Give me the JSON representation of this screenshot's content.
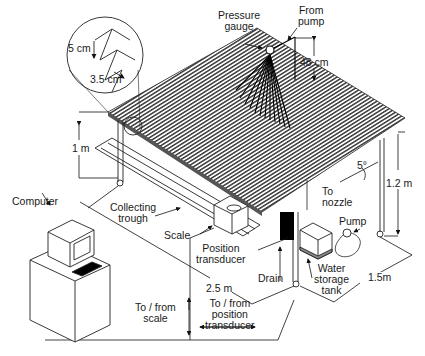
{
  "diagram": {
    "type": "experimental apparatus schematic",
    "labels": {
      "pressure_gauge": [
        "Pressure",
        "gauge"
      ],
      "from_pump": [
        "From",
        "pump"
      ],
      "nozzle_height": "48 cm",
      "corrugation_height": "5 cm",
      "corrugation_pitch": "3.5 cm",
      "front_height": "1 m",
      "rear_height": "1.2 m",
      "slope": "5°",
      "to_nozzle": [
        "To",
        "nozzle"
      ],
      "pump": "Pump",
      "computer": "Computer",
      "collecting_trough": [
        "Collecting",
        "trough"
      ],
      "scale": "Scale",
      "position_transducer": [
        "Position",
        "transducer"
      ],
      "drain": "Drain",
      "water_storage_tank": [
        "Water",
        "storage",
        "tank"
      ],
      "width_dim": "2.5 m",
      "depth_dim": "1.5m",
      "to_from_scale": [
        "To / from",
        "scale"
      ],
      "to_from_position_transducer": [
        "To / from",
        "position",
        "transducer"
      ]
    }
  }
}
